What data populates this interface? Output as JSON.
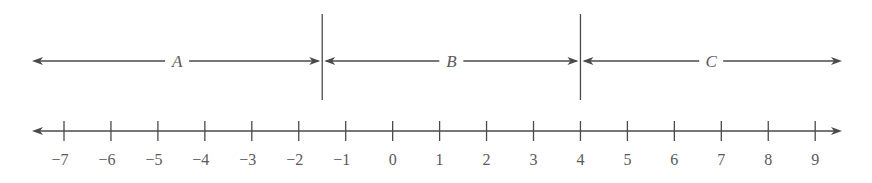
{
  "diagram": {
    "type": "number-line-regions",
    "colors": {
      "line": "#4a4a4a",
      "text": "#5a5a5a",
      "background": "#ffffff"
    },
    "upper_line": {
      "boundaries": [
        -1.5,
        4
      ],
      "regions": [
        {
          "label": "A",
          "from": "-infinity",
          "to": -1.5
        },
        {
          "label": "B",
          "from": -1.5,
          "to": 4
        },
        {
          "label": "C",
          "from": 4,
          "to": "infinity"
        }
      ]
    },
    "number_line": {
      "min": -7,
      "max": 9,
      "step": 1,
      "tick_labels": [
        "−7",
        "−6",
        "−5",
        "−4",
        "−3",
        "−2",
        "−1",
        "0",
        "1",
        "2",
        "3",
        "4",
        "5",
        "6",
        "7",
        "8",
        "9"
      ]
    }
  }
}
